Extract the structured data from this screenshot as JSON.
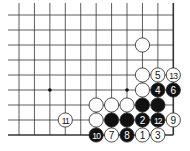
{
  "diagram": {
    "type": "go-board-fragment",
    "grid": {
      "cols": 11,
      "rows": 9,
      "origin_x": 19,
      "origin_y": 15,
      "spacing_x": 15.43,
      "spacing_y": 15,
      "edges": [
        "right",
        "bottom"
      ],
      "line_color": "#333333"
    },
    "star_points": [
      {
        "col": 2,
        "row": 5
      },
      {
        "col": 7,
        "row": 5
      }
    ],
    "stones": [
      {
        "color": "white",
        "col": 8,
        "row": 2,
        "label": ""
      },
      {
        "color": "white",
        "col": 8,
        "row": 4,
        "label": ""
      },
      {
        "color": "white",
        "col": 9,
        "row": 4,
        "label": "5"
      },
      {
        "color": "white",
        "col": 10,
        "row": 4,
        "label": "13"
      },
      {
        "color": "white",
        "col": 8,
        "row": 5,
        "label": ""
      },
      {
        "color": "black",
        "col": 9,
        "row": 5,
        "label": "4"
      },
      {
        "color": "black",
        "col": 10,
        "row": 5,
        "label": "6"
      },
      {
        "color": "white",
        "col": 5,
        "row": 6,
        "label": ""
      },
      {
        "color": "white",
        "col": 6,
        "row": 6,
        "label": ""
      },
      {
        "color": "white",
        "col": 7,
        "row": 6,
        "label": ""
      },
      {
        "color": "black",
        "col": 8,
        "row": 6,
        "label": ""
      },
      {
        "color": "black",
        "col": 9,
        "row": 6,
        "label": ""
      },
      {
        "color": "white",
        "col": 3,
        "row": 7,
        "label": "11"
      },
      {
        "color": "white",
        "col": 5,
        "row": 7,
        "label": ""
      },
      {
        "color": "black",
        "col": 6,
        "row": 7,
        "label": ""
      },
      {
        "color": "black",
        "col": 7,
        "row": 7,
        "label": ""
      },
      {
        "color": "black",
        "col": 8,
        "row": 7,
        "label": "2"
      },
      {
        "color": "black",
        "col": 9,
        "row": 7,
        "label": "12"
      },
      {
        "color": "white",
        "col": 10,
        "row": 7,
        "label": "9"
      },
      {
        "color": "black",
        "col": 5,
        "row": 8,
        "label": "10"
      },
      {
        "color": "white",
        "col": 6,
        "row": 8,
        "label": "7"
      },
      {
        "color": "black",
        "col": 7,
        "row": 8,
        "label": "8"
      },
      {
        "color": "white",
        "col": 8,
        "row": 8,
        "label": "1"
      },
      {
        "color": "white",
        "col": 9,
        "row": 8,
        "label": "3"
      }
    ],
    "colors": {
      "black_stone": "#111111",
      "white_stone": "#ffffff",
      "stone_outline": "#222222",
      "background": "#ffffff"
    }
  }
}
